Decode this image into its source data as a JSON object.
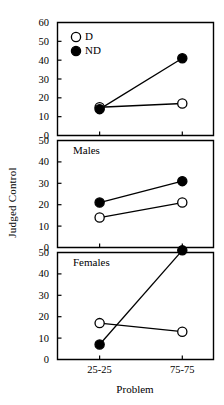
{
  "chart_data": {
    "type": "line",
    "title": "",
    "xlabel": "Problem",
    "ylabel": "Judged Control",
    "categories": [
      "25-25",
      "75-75"
    ],
    "legend": {
      "position": "top-left-panel",
      "entries": [
        {
          "name": "D",
          "marker": "open-circle"
        },
        {
          "name": "ND",
          "marker": "filled-circle"
        }
      ]
    },
    "grid": false,
    "panels": [
      {
        "label": "",
        "ylim": [
          0,
          60
        ],
        "yticks": [
          0,
          10,
          20,
          30,
          40,
          50,
          60
        ],
        "series": [
          {
            "name": "D",
            "marker": "open-circle",
            "values": [
              15,
              17
            ]
          },
          {
            "name": "ND",
            "marker": "filled-circle",
            "values": [
              14,
              41
            ]
          }
        ]
      },
      {
        "label": "Males",
        "ylim": [
          0,
          50
        ],
        "yticks": [
          0,
          10,
          20,
          30,
          40,
          50
        ],
        "series": [
          {
            "name": "D",
            "marker": "open-circle",
            "values": [
              14,
              21
            ]
          },
          {
            "name": "ND",
            "marker": "filled-circle",
            "values": [
              21,
              31
            ]
          }
        ]
      },
      {
        "label": "Females",
        "ylim": [
          0,
          50
        ],
        "yticks": [
          0,
          10,
          20,
          30,
          40,
          50
        ],
        "series": [
          {
            "name": "D",
            "marker": "open-circle",
            "values": [
              17,
              13
            ]
          },
          {
            "name": "ND",
            "marker": "filled-circle",
            "values": [
              7,
              51
            ]
          }
        ]
      }
    ],
    "colors": {
      "line": "#000000",
      "marker_fill": "#000000",
      "marker_open": "#ffffff",
      "axis": "#000000",
      "background": "#ffffff"
    }
  }
}
